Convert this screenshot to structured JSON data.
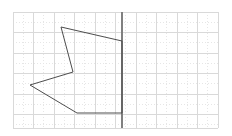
{
  "figure": {
    "background_color": "#ffffff",
    "canvas": {
      "width": 232,
      "height": 136
    }
  },
  "grid": {
    "name": "graph-paper-grid",
    "left": 13,
    "top": 12,
    "right": 218,
    "bottom": 128,
    "major_spacing": 20.5,
    "minor_spacing": 10.25,
    "major_color": "#d9d9d9",
    "minor_color": "#e6e6e6",
    "minor_dash": "1,2",
    "major_width": 1,
    "minor_width": 1,
    "major_x_lines": [
      13,
      33.5,
      54,
      74.5,
      95,
      115.5,
      136,
      156.5,
      177,
      197.5,
      218
    ],
    "major_y_lines": [
      12,
      32.5,
      53,
      73.5,
      94,
      114.5,
      128
    ],
    "minor_x_lines": [
      23.25,
      43.75,
      64.25,
      84.75,
      105.25,
      125.75,
      146.25,
      166.75,
      187.25,
      207.75
    ],
    "minor_y_lines": [
      22.25,
      42.75,
      63.25,
      83.75,
      104.25,
      124.75
    ]
  },
  "axis": {
    "name": "vertical-axis-line",
    "orientation": "vertical",
    "x": 122,
    "y_start": 12,
    "y_end": 128,
    "color": "#808080",
    "width": 1.6
  },
  "chart_data": {
    "type": "scatter",
    "xlabel": "",
    "ylabel": "",
    "grid": true,
    "legend": "none",
    "xlim": [
      13,
      218
    ],
    "ylim": [
      12,
      128
    ],
    "shapes": [
      {
        "name": "polygon",
        "closed": true,
        "stroke": "#4d4d4d",
        "stroke_width": 1,
        "fill": "none",
        "vertices": [
          [
            61,
            27
          ],
          [
            122,
            41
          ],
          [
            122,
            113
          ],
          [
            77,
            113
          ],
          [
            30,
            85
          ],
          [
            73,
            72
          ]
        ],
        "vertex_labels": [
          "top-apex",
          "upper-right-on-axis",
          "lower-right-on-axis",
          "bottom-notch",
          "left-point",
          "inner-concave-notch"
        ]
      }
    ]
  }
}
